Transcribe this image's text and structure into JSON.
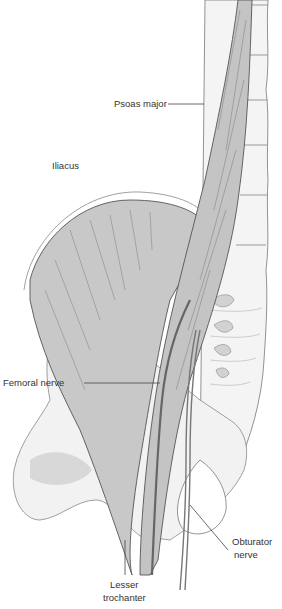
{
  "figure": {
    "type": "anatomical illustration",
    "labels": {
      "psoas_major": "Psoas major",
      "iliacus": "Iliacus",
      "femoral_nerve": "Femoral nerve",
      "obturator_nerve_line1": "Obturator",
      "obturator_nerve_line2": "nerve",
      "lesser_trochanter_line1": "Lesser",
      "lesser_trochanter_line2": "trochanter"
    },
    "colors": {
      "muscle_fill": "#c8c8c8",
      "bone_fill": "#f2f2f2",
      "bone_shade": "#d6d6d6",
      "outline": "#555555",
      "leader_line": "#444444",
      "label_text": "#333333"
    }
  }
}
